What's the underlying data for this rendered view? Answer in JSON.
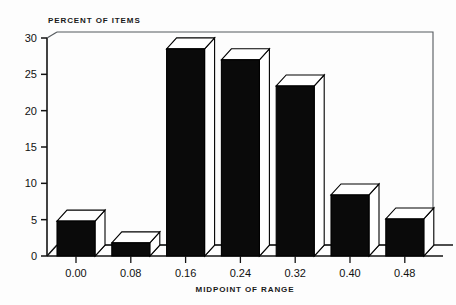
{
  "chart_data": {
    "type": "bar",
    "title": "",
    "subtitle": "",
    "xlabel": "MIDPOINT OF RANGE",
    "ylabel": "PERCENT OF ITEMS",
    "categories": [
      "0.00",
      "0.08",
      "0.16",
      "0.24",
      "0.32",
      "0.40",
      "0.48"
    ],
    "values": [
      4.8,
      1.8,
      28.5,
      27.0,
      23.4,
      8.4,
      5.1
    ],
    "ylim": [
      0,
      30
    ],
    "xlim": [
      -0.04,
      0.52
    ],
    "y_ticks": [
      "0",
      "5",
      "10",
      "15",
      "20",
      "25",
      "30"
    ],
    "y_tick_values": [
      0,
      5,
      10,
      15,
      20,
      25,
      30
    ],
    "x_ticks": [
      "0.00",
      "0.08",
      "0.16",
      "0.24",
      "0.32",
      "0.40",
      "0.48"
    ],
    "grid": false,
    "legend": null,
    "style": "3d-bars",
    "bar_color": "#0a0a0a",
    "bar_highlight_color": "#ffffff",
    "axis_color": "#131313",
    "frame_color": "#555a5e",
    "background_color": "#fdfdfd"
  },
  "labels": {
    "y_axis_title": "PERCENT OF ITEMS",
    "x_axis_title": "MIDPOINT OF RANGE"
  }
}
